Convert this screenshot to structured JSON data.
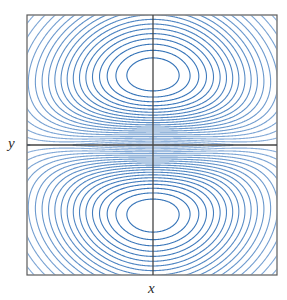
{
  "figure": {
    "name": "contour-plot",
    "background_color": "#ffffff",
    "frame": {
      "color": "#5a5a5a",
      "line_width": 1.2,
      "x_left": 27,
      "x_right": 277,
      "y_top": 15,
      "y_bottom": 275
    },
    "axes": {
      "color": "#444444",
      "line_width": 1.3,
      "origin_x": 153,
      "origin_y": 145
    }
  },
  "labels": {
    "x": "x",
    "y": "y"
  },
  "chart_data": {
    "type": "line",
    "subtype": "contour",
    "title": "",
    "xlabel": "x",
    "ylabel": "y",
    "grid": false,
    "legend": false,
    "legend_position": "none",
    "xlim": [
      -1.0,
      1.0
    ],
    "ylim": [
      -1.04,
      1.04
    ],
    "axis_ticks": [],
    "tick_labels": [],
    "contour_color_low": "#aec7e8",
    "contour_color_high": "#2f6fb5",
    "contour_line_width": 1.1,
    "n_levels": 22,
    "critical_points": [
      {
        "kind": "extremum",
        "label": "upper-lobe-center",
        "x": 0.0,
        "y": 0.42
      },
      {
        "kind": "extremum",
        "label": "lower-lobe-center",
        "x": 0.0,
        "y": -0.42
      },
      {
        "kind": "saddle",
        "label": "center-saddle",
        "x": 0.0,
        "y": 0.0
      },
      {
        "kind": "saddle",
        "label": "left-saddle",
        "x": -0.39,
        "y": 0.0
      },
      {
        "kind": "saddle",
        "label": "right-saddle",
        "x": 0.39,
        "y": 0.0
      }
    ],
    "extent": {
      "outer_contour_x": [
        -0.78,
        0.8
      ],
      "outer_contour_y": [
        -0.99,
        0.93
      ]
    }
  }
}
